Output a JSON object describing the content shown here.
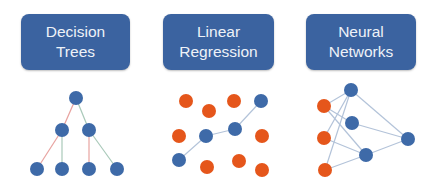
{
  "colors": {
    "card_bg": "#3b63a0",
    "card_text": "#eef2f8",
    "blue_node": "#3e6aa8",
    "orange_node": "#e5561b",
    "edge_red": "#e8a3a0",
    "edge_green": "#a9c9b9",
    "edge_gray": "#b3c3d9"
  },
  "panels": [
    {
      "id": "decision-trees",
      "title_lines": [
        "Decision",
        "Trees"
      ],
      "diagram": {
        "type": "tree",
        "nodes": [
          {
            "id": "root",
            "x": 76,
            "y": 98,
            "color": "blue"
          },
          {
            "id": "l1",
            "x": 62,
            "y": 130,
            "color": "blue"
          },
          {
            "id": "r1",
            "x": 89,
            "y": 130,
            "color": "blue"
          },
          {
            "id": "leaf1",
            "x": 37,
            "y": 169,
            "color": "blue"
          },
          {
            "id": "leaf2",
            "x": 62,
            "y": 169,
            "color": "blue"
          },
          {
            "id": "leaf3",
            "x": 89,
            "y": 169,
            "color": "blue"
          },
          {
            "id": "leaf4",
            "x": 117,
            "y": 169,
            "color": "blue"
          }
        ],
        "edges": [
          {
            "from": "root",
            "to": "l1",
            "color": "red"
          },
          {
            "from": "root",
            "to": "r1",
            "color": "green"
          },
          {
            "from": "l1",
            "to": "leaf1",
            "color": "red"
          },
          {
            "from": "l1",
            "to": "leaf2",
            "color": "green"
          },
          {
            "from": "r1",
            "to": "leaf3",
            "color": "red"
          },
          {
            "from": "r1",
            "to": "leaf4",
            "color": "green"
          }
        ]
      }
    },
    {
      "id": "linear-regression",
      "title_lines": [
        "Linear",
        "Regression"
      ],
      "diagram": {
        "type": "scatter-with-line",
        "orange_points": [
          {
            "x": 186,
            "y": 101
          },
          {
            "x": 209,
            "y": 111
          },
          {
            "x": 234,
            "y": 101
          },
          {
            "x": 179,
            "y": 136
          },
          {
            "x": 262,
            "y": 136
          },
          {
            "x": 207,
            "y": 167
          },
          {
            "x": 239,
            "y": 161
          },
          {
            "x": 262,
            "y": 170
          }
        ],
        "blue_points": [
          {
            "x": 179,
            "y": 160
          },
          {
            "x": 206,
            "y": 136
          },
          {
            "x": 235,
            "y": 129
          },
          {
            "x": 261,
            "y": 101
          }
        ]
      }
    },
    {
      "id": "neural-networks",
      "title_lines": [
        "Neural",
        "Networks"
      ],
      "diagram": {
        "type": "network",
        "nodes": [
          {
            "id": "in1",
            "x": 324,
            "y": 106,
            "color": "orange"
          },
          {
            "id": "in2",
            "x": 324,
            "y": 138,
            "color": "orange"
          },
          {
            "id": "in3",
            "x": 325,
            "y": 170,
            "color": "orange"
          },
          {
            "id": "h1",
            "x": 351,
            "y": 90,
            "color": "blue"
          },
          {
            "id": "h2",
            "x": 352,
            "y": 123,
            "color": "blue"
          },
          {
            "id": "h3",
            "x": 366,
            "y": 155,
            "color": "blue"
          },
          {
            "id": "out",
            "x": 408,
            "y": 139,
            "color": "blue"
          }
        ],
        "edges": [
          {
            "from": "h1",
            "to": "in1"
          },
          {
            "from": "h1",
            "to": "in2"
          },
          {
            "from": "h1",
            "to": "in3"
          },
          {
            "from": "in1",
            "to": "h2"
          },
          {
            "from": "in1",
            "to": "h3"
          },
          {
            "from": "in2",
            "to": "h3"
          },
          {
            "from": "in3",
            "to": "h3"
          },
          {
            "from": "h1",
            "to": "out"
          },
          {
            "from": "h2",
            "to": "out"
          },
          {
            "from": "h3",
            "to": "out"
          }
        ]
      }
    }
  ]
}
